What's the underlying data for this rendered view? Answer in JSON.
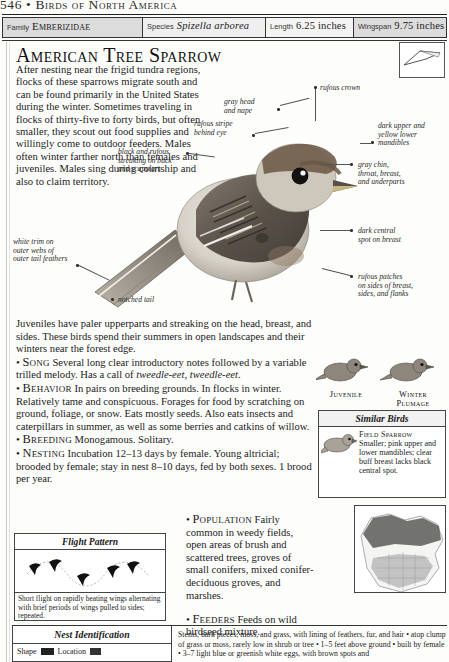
{
  "running_head": {
    "page_number": "546",
    "separator": "•",
    "book_title": "Birds of North America"
  },
  "spec_bar": [
    {
      "key": "Family",
      "value": "Emberizidae",
      "style": "smallcaps"
    },
    {
      "key": "Species",
      "value": "Spizella arborea",
      "style": "italic"
    },
    {
      "key": "Length",
      "value": "6.25 inches",
      "style": "plain"
    },
    {
      "key": "Wingspan",
      "value": "9.75 inches",
      "style": "plain"
    }
  ],
  "species": {
    "common_name": "American Tree Sparrow",
    "intro": "After nesting near the frigid tundra regions, flocks of these sparrows migrate south and can be found primarily in the United States during the winter. Sometimes traveling in flocks of thirty-five to forty birds, but often smaller, they scout out food supplies and willingly come to outdoor feeders. Males often winter farther north than females and juveniles. Males sing during courtship and also to claim territory.",
    "juvenile_note": "Juveniles have paler upperparts and streaking on the head, breast, and sides. These birds spend their summers in open landscapes and their winters near the forest edge."
  },
  "sections": [
    {
      "heading": "Song",
      "text_before_italic": "Several long clear introductory notes followed by a variable trilled melody. Has a call of ",
      "italic": "tweedle-eet, tweedle-eet",
      "text_after_italic": "."
    },
    {
      "heading": "Behavior",
      "text": "In pairs on breeding grounds. In flocks in winter. Relatively tame and conspicuous. Forages for food by scratching on ground, foliage, or snow. Eats mostly seeds. Also eats insects and caterpillars in summer, as well as some berries and catkins of willow."
    },
    {
      "heading": "Breeding",
      "text": "Monogamous. Solitary."
    },
    {
      "heading": "Nesting",
      "text": "Incubation 12–13 days by female. Young altricial; brooded by female; stay in nest 8–10 days, fed by both sexes. 1 brood per year."
    }
  ],
  "right_sections": [
    {
      "heading": "Population",
      "text": "Fairly common in weedy fields, open areas of brush and scattered trees, groves of small conifers, mixed conifer-deciduous groves, and marshes."
    },
    {
      "heading": "Feeders",
      "text": "Feeds on wild birdseed mixture."
    }
  ],
  "callouts": [
    {
      "id": "rufous-crown",
      "text": "rufous crown"
    },
    {
      "id": "gray-head-nape",
      "text": "gray head\nand nape"
    },
    {
      "id": "rufous-stripe",
      "text": "rufous stripe\nbehind eye"
    },
    {
      "id": "black-rufous-streaking",
      "text": "black and rufous\nstreaking on back\nand scapulars"
    },
    {
      "id": "mandibles",
      "text": "dark upper and\nyellow lower\nmandibles"
    },
    {
      "id": "gray-chin",
      "text": "gray chin,\nthroat, breast,\nand underparts"
    },
    {
      "id": "dark-central-spot",
      "text": "dark central\nspot on breast"
    },
    {
      "id": "rufous-patches",
      "text": "rufous patches\non sides of breast,\nsides, and flanks"
    },
    {
      "id": "white-trim",
      "text": "white trim on\nouter webs of\nouter tail feathers"
    },
    {
      "id": "notched-tail",
      "text": "notched tail"
    }
  ],
  "plumage_labels": [
    {
      "id": "juvenile",
      "text": "Juvenile"
    },
    {
      "id": "winter-plumage",
      "text": "Winter\nPlumage"
    }
  ],
  "similar_birds": {
    "title": "Similar Birds",
    "entries": [
      {
        "name": "Field Sparrow",
        "description": "Smaller; pink upper and lower mandibles; clear buff breast lacks black central spot."
      }
    ]
  },
  "flight_pattern": {
    "title": "Flight Pattern",
    "caption": "Short flight on rapidly beating wings alternating with brief periods of wings pulled to sides; repeated."
  },
  "nest_identification": {
    "title": "Nest Identification",
    "shape_label": "Shape",
    "location_label": "Location",
    "description": "Stems, bark pieces, moss, and grass, with lining of feathers, fur, and hair • atop clump of grass or moss, rarely low in shrub or tree • 1–5 feet above ground • built by female • 3–7 light blue or greenish white eggs, with brown spots and"
  },
  "range_map": {
    "legend_breeding_color": "#4a4a4a",
    "legend_winter_color": "#b6b6b6"
  },
  "colors": {
    "ink": "#1a1a1a",
    "rule": "#333333",
    "bar_fill": "#dcdcdc",
    "paper": "#fdfdfb"
  }
}
